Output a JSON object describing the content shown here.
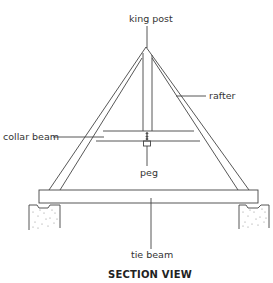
{
  "diagram": {
    "title": "SECTION VIEW",
    "labels": {
      "king_post": "king post",
      "rafter": "rafter",
      "collar_beam": "collar beam",
      "peg": "peg",
      "tie_beam": "tie beam"
    },
    "colors": {
      "line": "#444444",
      "fill": "#ffffff",
      "masonry_dots": "#777777"
    }
  }
}
